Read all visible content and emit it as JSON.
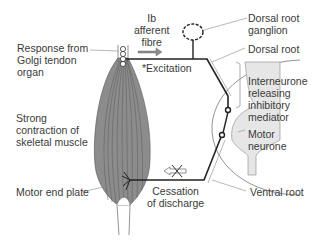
{
  "diagram": {
    "labels": {
      "response": "Response from\nGolgi tendon\norgan",
      "ib_fibre": "Ib\nafferent\nfibre",
      "excitation": "*Excitation",
      "dorsal_root_ganglion": "Dorsal root\nganglion",
      "dorsal_root": "Dorsal root",
      "interneurone": "Interneurone\nreleasing\ninhibitory\nmediator",
      "motor_neurone": "Motor\nneurone",
      "strong_contraction": "Strong\ncontraction of\nskeletal muscle",
      "motor_end_plate": "Motor end plate",
      "cessation": "Cessation\nof discharge",
      "ventral_root": "Ventral root"
    },
    "colors": {
      "muscle_fill": "#8c8c8c",
      "muscle_lines": "#555555",
      "nerve": "#222222",
      "arrow": "#8a8a8a",
      "grey_matter": "#e6e6e6",
      "label_line": "#888888"
    }
  }
}
